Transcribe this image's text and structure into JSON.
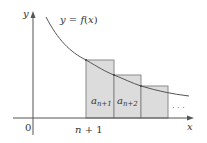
{
  "figure": {
    "curve_label": "y = f(x)",
    "curve_label_parts": {
      "y": "y",
      "eq": " = ",
      "f": "f",
      "open": "(",
      "x": "x",
      "close": ")"
    },
    "y_axis_label": "y",
    "x_axis_label": "x",
    "origin_label": "0",
    "tick_label_parts": {
      "n": "n",
      "rest": " + 1"
    },
    "rectangles": [
      {
        "label_base": "a",
        "label_sub": "n+1"
      },
      {
        "label_base": "a",
        "label_sub": "n+2"
      },
      {
        "label_base": "",
        "label_sub": ""
      }
    ],
    "ellipsis": "· · ·",
    "colors": {
      "axis": "#555555",
      "curve": "#555555",
      "rect_fill": "#dcdcdc",
      "rect_stroke": "#8a8a8a",
      "text": "#333333"
    }
  }
}
